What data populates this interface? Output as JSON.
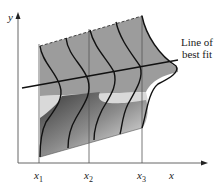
{
  "diagram": {
    "axes": {
      "y_label": "y",
      "x_label": "x"
    },
    "x_ticks": [
      {
        "var": "x",
        "sub": "1"
      },
      {
        "var": "x",
        "sub": "2"
      },
      {
        "var": "x",
        "sub": "3"
      }
    ],
    "annotation": {
      "line1": "Line of",
      "line2": "best fit"
    },
    "colors": {
      "surface_dark": "#4a4a4a",
      "surface_mid": "#9a9a9a",
      "surface_light": "#f0f0f0",
      "curve": "#111111",
      "axis": "#555555"
    }
  }
}
